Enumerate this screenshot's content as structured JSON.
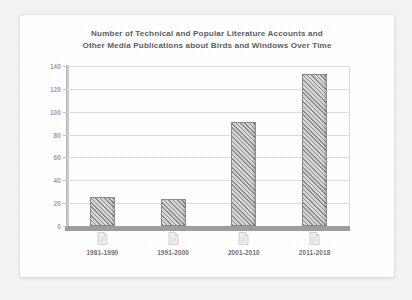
{
  "chart_data": {
    "type": "bar",
    "title": "Number of Technical and Popular Literature Accounts and\nOther Media Publications about Birds and Windows Over Time",
    "xlabel": "",
    "ylabel": "",
    "categories": [
      "1981-1990",
      "1991-2000",
      "2001-2010",
      "2011-2018"
    ],
    "values": [
      25,
      24,
      91,
      133
    ],
    "ylim": [
      0,
      140
    ],
    "yticks": [
      0,
      20,
      40,
      60,
      80,
      100,
      120,
      140
    ],
    "ytick_labels": [
      "0",
      "20",
      "40",
      "60",
      "80",
      "100",
      "120",
      "140"
    ],
    "grid": true,
    "legend": null,
    "series": [
      {
        "name": "Publications",
        "values": [
          25,
          24,
          91,
          133
        ]
      }
    ],
    "category_icons": [
      "document-icon",
      "document-icon",
      "document-icon",
      "document-icon"
    ],
    "colors": {
      "bar_fill": "#d2d2d2",
      "bar_hatch": "#8d8d8d",
      "bar_edge": "#8a8a8a",
      "gridline": "#dcdcdc",
      "axis": "#9d9d9d",
      "title_text": "#5d5d63",
      "tick_text": "#9b9b9e",
      "category_text": "#6f6f73",
      "page_background": "#ffffff",
      "canvas_background": "#f2f2f2"
    }
  }
}
